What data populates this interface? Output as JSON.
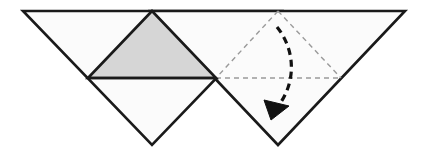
{
  "figure": {
    "caption": "",
    "canvas": {
      "width": 422,
      "height": 165,
      "background": "#ffffff"
    },
    "colors": {
      "paper_fill": "#fbfbfb",
      "shaded_fill": "#d6d6d6",
      "solid_stroke": "#1a1a1a",
      "dashed_stroke": "#9a9a9a",
      "arrow_stroke": "#111111",
      "background": "#ffffff"
    },
    "strokes": {
      "solid_width": 2.6,
      "shaded_edge_width": 2.6,
      "dashed_width": 1.4,
      "dashed_pattern": "5,4",
      "arrow_width": 3.2,
      "arrow_pattern": "7,5"
    },
    "shapes": {
      "left_sheet": {
        "name": "left-triangle-sheet",
        "points": "23,11 281,11 152,145",
        "fill": "#fbfbfb",
        "stroke": "#1a1a1a"
      },
      "right_sheet": {
        "name": "right-triangle-sheet",
        "points": "151,11 405,11 278,145",
        "fill": "#fbfbfb",
        "stroke": "#1a1a1a"
      },
      "shaded_flap": {
        "name": "shaded-center-flap",
        "points": "88,78 152,11 216,78",
        "fill": "#d6d6d6",
        "stroke": "#1a1a1a"
      },
      "fold_baseline": {
        "name": "horizontal-fold-line",
        "x1": 88,
        "y1": 78,
        "x2": 216,
        "y2": 78
      }
    },
    "guides": [
      {
        "name": "dashed-left-crease",
        "x1": 278,
        "y1": 11,
        "x2": 216,
        "y2": 78
      },
      {
        "name": "dashed-right-crease",
        "x1": 278,
        "y1": 11,
        "x2": 341,
        "y2": 78
      },
      {
        "name": "dashed-horizontal-crease",
        "x1": 216,
        "y1": 78,
        "x2": 341,
        "y2": 78
      }
    ],
    "arrow": {
      "name": "fold-direction-arrow",
      "path": "M 277,27 C 297,52 296,86 275,110",
      "head_points": "271,119 266,101 288,107",
      "start": [
        277,
        27
      ],
      "end": [
        273,
        117
      ],
      "direction": "down",
      "meaning": "fold flap downward"
    }
  }
}
